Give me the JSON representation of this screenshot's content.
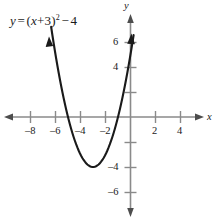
{
  "figure": {
    "title": "",
    "equation": {
      "lhs": "y",
      "equals": "=",
      "open_paren": "(",
      "var": "x",
      "plus": "+",
      "inner_const": "3",
      "close_paren": ")",
      "exponent": "2",
      "minus": "−",
      "outer_const": "4",
      "plain_text": "y = (x + 3)² − 4"
    },
    "axes": {
      "x_axis_label": "x",
      "y_axis_label": "y",
      "x_ticks": [
        {
          "value": -8,
          "label": "–8"
        },
        {
          "value": -6,
          "label": "–6"
        },
        {
          "value": -4,
          "label": "–4"
        },
        {
          "value": -2,
          "label": "–2"
        },
        {
          "value": 2,
          "label": "2"
        },
        {
          "value": 4,
          "label": "4"
        }
      ],
      "y_ticks": [
        {
          "value": 6,
          "label": "6"
        },
        {
          "value": 4,
          "label": "4"
        },
        {
          "value": 2,
          "label": ""
        },
        {
          "value": -2,
          "label": ""
        },
        {
          "value": -4,
          "label": "–4"
        },
        {
          "value": -6,
          "label": "–6"
        }
      ],
      "xlim": [
        -9.5,
        5.5
      ],
      "ylim": [
        -7.5,
        7.5
      ],
      "grid": false,
      "axis_color": "#8a8a8a",
      "curve_color": "#1a1a1a"
    }
  },
  "chart_data": {
    "type": "line",
    "title": "",
    "subtitle": "",
    "xlabel": "x",
    "ylabel": "y",
    "xlim": [
      -9.5,
      5.5
    ],
    "ylim": [
      -7.5,
      7.5
    ],
    "grid": false,
    "legend_position": "none",
    "annotations": [
      {
        "text": "y = (x + 3)² − 4",
        "x": -8.2,
        "y": 6.6
      }
    ],
    "series": [
      {
        "name": "y = (x + 3)^2 - 4",
        "equation": "y = (x + 3)^2 - 4",
        "vertex": [
          -3,
          -4
        ],
        "x_intercepts": [
          -5,
          -1
        ],
        "y_intercept": [
          0,
          5
        ],
        "axis_of_symmetry": -3,
        "opens": "up",
        "x": [
          -6.4,
          -6.0,
          -5.5,
          -5.0,
          -4.5,
          -4.0,
          -3.5,
          -3.0,
          -2.5,
          -2.0,
          -1.5,
          -1.0,
          -0.5,
          0.0,
          0.2
        ],
        "values": [
          7.56,
          5.0,
          2.25,
          0.0,
          -1.75,
          -3.0,
          -3.75,
          -4.0,
          -3.75,
          -3.0,
          -1.75,
          0.0,
          2.25,
          5.0,
          6.24
        ]
      }
    ],
    "x_tick_labels": [
      "–8",
      "–6",
      "–4",
      "–2",
      "2",
      "4"
    ],
    "x_tick_values": [
      -8,
      -6,
      -4,
      -2,
      2,
      4
    ],
    "y_tick_labels": [
      "6",
      "4",
      "–4",
      "–6"
    ],
    "y_tick_values": [
      6,
      4,
      -4,
      -6
    ]
  }
}
